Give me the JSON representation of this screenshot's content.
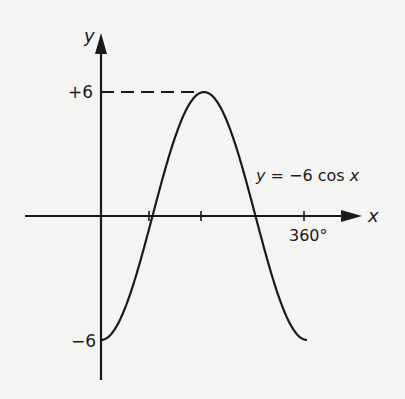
{
  "chart_data": {
    "type": "line",
    "title": "",
    "equation_label": "y = −6 cos x",
    "xlabel": "x",
    "ylabel": "y",
    "x_tick_labels": [
      "360°"
    ],
    "x_ticks_deg": [
      90,
      180,
      360
    ],
    "y_tick_labels": [
      "+6",
      "−6"
    ],
    "xlim": [
      0,
      360
    ],
    "ylim": [
      -6,
      6
    ],
    "grid": false,
    "series": [
      {
        "name": "y = −6 cos x",
        "function": "-6*cos(x)",
        "x": [
          0,
          45,
          90,
          135,
          180,
          225,
          270,
          315,
          360
        ],
        "values": [
          -6,
          -4.24,
          0,
          4.24,
          6,
          4.24,
          0,
          -4.24,
          -6
        ]
      }
    ],
    "annotations": [
      "dashed line from y-axis at +6 to maximum at x=180°"
    ]
  },
  "labels": {
    "y_axis": "y",
    "x_axis": "x",
    "plus6": "+6",
    "minus6": "−6",
    "x360": "360°",
    "equation": "y = −6 cos x"
  }
}
